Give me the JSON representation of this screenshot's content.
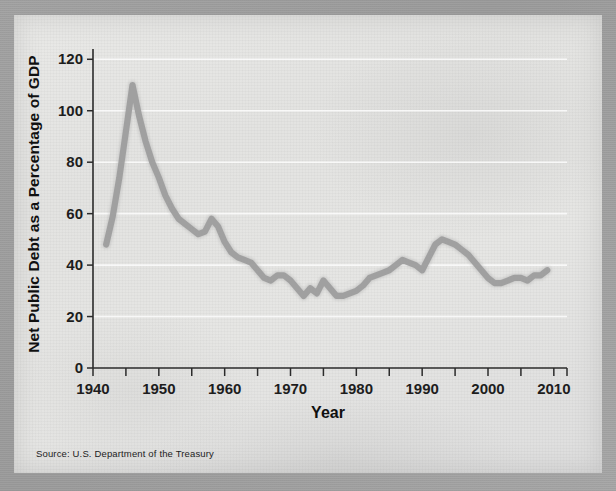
{
  "figure": {
    "source_note": "Source: U.S. Department of the Treasury"
  },
  "chart_data": {
    "type": "line",
    "title": "",
    "xlabel": "Year",
    "ylabel": "Net Public Debt as a Percentage of GDP",
    "xlim": [
      1940,
      2012
    ],
    "ylim": [
      0,
      124
    ],
    "xticks": [
      1940,
      1950,
      1960,
      1970,
      1980,
      1990,
      2000,
      2010
    ],
    "xtick_labels": [
      "1940",
      "1950",
      "1960",
      "1970",
      "1980",
      "1990",
      "2000",
      "2010"
    ],
    "xminor_tick_step": 5,
    "yticks": [
      0,
      20,
      40,
      60,
      80,
      100,
      120
    ],
    "ytick_labels": [
      "0",
      "20",
      "40",
      "60",
      "80",
      "100",
      "120"
    ],
    "grid": "horizontal-white",
    "legend": "none",
    "line_color": "#9c9c9c",
    "series": [
      {
        "name": "Net public debt as a percentage of GDP",
        "x": [
          1942,
          1943,
          1944,
          1945,
          1946,
          1947,
          1948,
          1949,
          1950,
          1951,
          1952,
          1953,
          1954,
          1955,
          1956,
          1957,
          1958,
          1959,
          1960,
          1961,
          1962,
          1963,
          1964,
          1965,
          1966,
          1967,
          1968,
          1969,
          1970,
          1971,
          1972,
          1973,
          1974,
          1975,
          1976,
          1977,
          1978,
          1979,
          1980,
          1981,
          1982,
          1983,
          1984,
          1985,
          1986,
          1987,
          1988,
          1989,
          1990,
          1991,
          1992,
          1993,
          1994,
          1995,
          1996,
          1997,
          1998,
          1999,
          2000,
          2001,
          2002,
          2003,
          2004,
          2005,
          2006,
          2007,
          2008,
          2009
        ],
        "y": [
          48,
          59,
          74,
          92,
          110,
          98,
          88,
          80,
          74,
          67,
          62,
          58,
          56,
          54,
          52,
          53,
          58,
          55,
          49,
          45,
          43,
          42,
          41,
          38,
          35,
          34,
          36,
          36,
          34,
          31,
          28,
          31,
          29,
          34,
          31,
          28,
          28,
          29,
          30,
          32,
          35,
          36,
          37,
          38,
          40,
          42,
          41,
          40,
          38,
          43,
          48,
          50,
          49,
          48,
          46,
          44,
          41,
          38,
          35,
          33,
          33,
          34,
          35,
          35,
          34,
          36,
          36,
          38
        ],
        "units": "percent of GDP"
      }
    ],
    "annotations": [
      {
        "text": "peak",
        "x": 1946,
        "y": 110
      },
      {
        "text": "trough",
        "x": 1977,
        "y": 28
      },
      {
        "text": "secondary-peak",
        "x": 1993,
        "y": 50
      }
    ]
  }
}
